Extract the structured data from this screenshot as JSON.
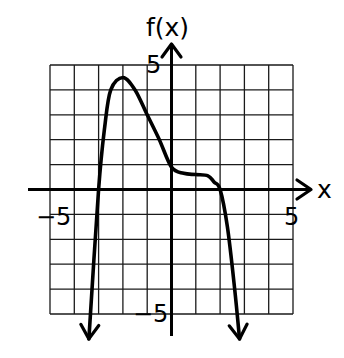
{
  "chart_data": {
    "type": "line",
    "title": "",
    "xlabel": "x",
    "ylabel": "f(x)",
    "xlim": [
      -5,
      5
    ],
    "ylim": [
      -5,
      5
    ],
    "grid": true,
    "grid_step": 1,
    "tick_labels": {
      "x": [
        {
          "value": -5,
          "label": "-5"
        },
        {
          "value": 5,
          "label": "5"
        }
      ],
      "y": [
        {
          "value": 5,
          "label": "5"
        },
        {
          "value": -5,
          "label": "-5"
        }
      ]
    },
    "series": [
      {
        "name": "f(x)",
        "description": "Polynomial-like curve with arrows on both ends pointing downward",
        "x": [
          -3.4,
          -3.0,
          -2.75,
          -2.5,
          -2.0,
          -1.5,
          -1.0,
          -0.5,
          0.0,
          0.5,
          1.0,
          1.5,
          1.75,
          2.0,
          2.3,
          2.6,
          2.8
        ],
        "y": [
          -6.0,
          0.0,
          2.5,
          4.0,
          4.5,
          4.0,
          3.0,
          2.0,
          0.9,
          0.65,
          0.6,
          0.55,
          0.3,
          0.0,
          -1.5,
          -4.0,
          -6.0
        ],
        "end_behavior": {
          "left": "down-arrow",
          "right": "down-arrow"
        }
      }
    ],
    "annotations": {
      "local_max": {
        "x": -2,
        "y": 4.5
      },
      "x_intercepts": [
        -3,
        2
      ],
      "y_intercept": 0.9,
      "flat_region": {
        "x_from": 0.5,
        "x_to": 1.5,
        "y": 0.6
      }
    },
    "legend": null
  },
  "labels": {
    "y_axis_title": "f(x)",
    "x_axis_title": "x",
    "x_min_tick": "−5",
    "x_max_tick": "5",
    "y_max_tick": "5",
    "y_min_tick": "−5"
  }
}
